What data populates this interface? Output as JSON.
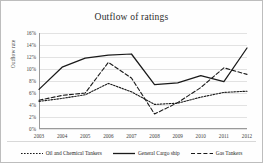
{
  "chart_data": {
    "type": "line",
    "title": "Outflow of ratings",
    "xlabel": "",
    "ylabel": "Outflow rate",
    "categories": [
      "2003",
      "2004",
      "2005",
      "2006",
      "2007",
      "2008",
      "2009",
      "2010",
      "2011",
      "2012"
    ],
    "x": [
      2003,
      2004,
      2005,
      2006,
      2007,
      2008,
      2009,
      2010,
      2011,
      2012
    ],
    "ylim": [
      0,
      16
    ],
    "yticks": [
      0,
      2,
      4,
      6,
      8,
      10,
      12,
      14,
      16
    ],
    "ytick_labels": [
      "0%",
      "2%",
      "4%",
      "6%",
      "8%",
      "10%",
      "12%",
      "14%",
      "16%"
    ],
    "grid": true,
    "legend_position": "bottom",
    "series": [
      {
        "name": "Oil and Chemical Tankers",
        "style": "dotted",
        "color": "#1a1a1a",
        "values": [
          4.6,
          5.1,
          5.7,
          7.6,
          6.2,
          4.1,
          4.3,
          5.3,
          6.1,
          6.3
        ]
      },
      {
        "name": "General Cargo ship",
        "style": "solid",
        "color": "#1a1a1a",
        "values": [
          6.6,
          10.3,
          11.8,
          12.3,
          12.5,
          7.4,
          7.7,
          8.9,
          7.9,
          13.5
        ]
      },
      {
        "name": "Gas Tankers",
        "style": "dashed",
        "color": "#1a1a1a",
        "values": [
          4.8,
          5.6,
          6.0,
          11.1,
          8.5,
          2.5,
          4.4,
          6.9,
          10.2,
          9.1
        ]
      }
    ]
  }
}
